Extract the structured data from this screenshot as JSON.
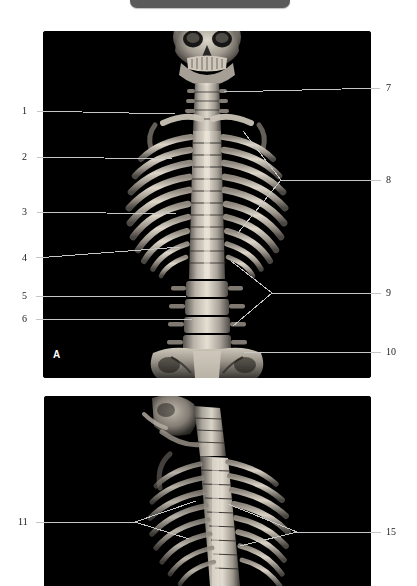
{
  "figure": {
    "type": "ct-3d-spine-reconstruction",
    "background_color": "#ffffff",
    "panel_background_color": "#000000",
    "leader_line_color": "#c8c8c8",
    "label_text_color": "#1a1a1a"
  },
  "topbar": {
    "name": "truncated-toolbar",
    "color": "#5b5b5b"
  },
  "panels": [
    {
      "id": "A",
      "letter": "A",
      "view": "anterior-coronal",
      "x": 43,
      "y": 31,
      "width": 328,
      "height": 347
    },
    {
      "id": "B",
      "letter": "",
      "view": "oblique-lateral",
      "x": 44,
      "y": 396,
      "width": 327,
      "height": 190
    }
  ],
  "labels": [
    {
      "id": "1",
      "text": "1",
      "panel": "A",
      "side": "left",
      "tx": 25,
      "ty": 111,
      "type": "straight"
    },
    {
      "id": "2",
      "text": "2",
      "panel": "A",
      "side": "left",
      "tx": 25,
      "ty": 157,
      "type": "straight"
    },
    {
      "id": "3",
      "text": "3",
      "panel": "A",
      "side": "left",
      "tx": 25,
      "ty": 212,
      "type": "straight"
    },
    {
      "id": "4",
      "text": "4",
      "panel": "A",
      "side": "left",
      "tx": 25,
      "ty": 257,
      "type": "straight"
    },
    {
      "id": "5",
      "text": "5",
      "panel": "A",
      "side": "left",
      "tx": 25,
      "ty": 295,
      "type": "straight"
    },
    {
      "id": "6",
      "text": "6",
      "panel": "A",
      "side": "left",
      "tx": 25,
      "ty": 319,
      "type": "straight"
    },
    {
      "id": "7",
      "text": "7",
      "panel": "A",
      "side": "right",
      "tx": 388,
      "ty": 88,
      "type": "straight"
    },
    {
      "id": "8",
      "text": "8",
      "panel": "A",
      "side": "right",
      "tx": 388,
      "ty": 180,
      "type": "branched"
    },
    {
      "id": "9",
      "text": "9",
      "panel": "A",
      "side": "right",
      "tx": 388,
      "ty": 292,
      "type": "branched"
    },
    {
      "id": "10",
      "text": "10",
      "panel": "A",
      "side": "right",
      "tx": 388,
      "ty": 352,
      "type": "straight"
    },
    {
      "id": "11",
      "text": "11",
      "panel": "B",
      "side": "left",
      "tx": 22,
      "ty": 522,
      "type": "branched"
    },
    {
      "id": "15",
      "text": "15",
      "panel": "B",
      "side": "right",
      "tx": 388,
      "ty": 532,
      "type": "branched"
    }
  ],
  "leader_lines": {
    "straight": [
      {
        "for": "1",
        "x1": 36,
        "y1": 111,
        "x2": 175,
        "y2": 114
      },
      {
        "for": "2",
        "x1": 36,
        "y1": 157,
        "x2": 172,
        "y2": 159
      },
      {
        "for": "3",
        "x1": 36,
        "y1": 212,
        "x2": 176,
        "y2": 214
      },
      {
        "for": "4",
        "x1": 36,
        "y1": 258,
        "x2": 180,
        "y2": 247
      },
      {
        "for": "5",
        "x1": 36,
        "y1": 296,
        "x2": 186,
        "y2": 296
      },
      {
        "for": "6",
        "x1": 36,
        "y1": 319,
        "x2": 192,
        "y2": 319
      },
      {
        "for": "7",
        "x1": 381,
        "y1": 88,
        "x2": 224,
        "y2": 92
      },
      {
        "for": "10",
        "x1": 381,
        "y1": 352,
        "x2": 244,
        "y2": 352
      }
    ],
    "branched": [
      {
        "for": "8",
        "stem": {
          "x1": 381,
          "y1": 180,
          "x2": 281,
          "y2": 180
        },
        "arms": [
          {
            "x1": 281,
            "y1": 180,
            "x2": 243,
            "y2": 131
          },
          {
            "x1": 281,
            "y1": 180,
            "x2": 238,
            "y2": 233
          }
        ]
      },
      {
        "for": "9",
        "stem": {
          "x1": 381,
          "y1": 293,
          "x2": 272,
          "y2": 293
        },
        "arms": [
          {
            "x1": 272,
            "y1": 293,
            "x2": 231,
            "y2": 261
          },
          {
            "x1": 272,
            "y1": 293,
            "x2": 233,
            "y2": 326
          }
        ]
      },
      {
        "for": "11",
        "stem": {
          "x1": 36,
          "y1": 522,
          "x2": 135,
          "y2": 522
        },
        "arms": [
          {
            "x1": 135,
            "y1": 522,
            "x2": 196,
            "y2": 501
          },
          {
            "x1": 135,
            "y1": 522,
            "x2": 189,
            "y2": 539
          }
        ]
      },
      {
        "for": "15",
        "stem": {
          "x1": 381,
          "y1": 532,
          "x2": 297,
          "y2": 532
        },
        "arms": [
          {
            "x1": 297,
            "y1": 532,
            "x2": 228,
            "y2": 504
          },
          {
            "x1": 297,
            "y1": 532,
            "x2": 240,
            "y2": 546
          }
        ]
      }
    ]
  }
}
